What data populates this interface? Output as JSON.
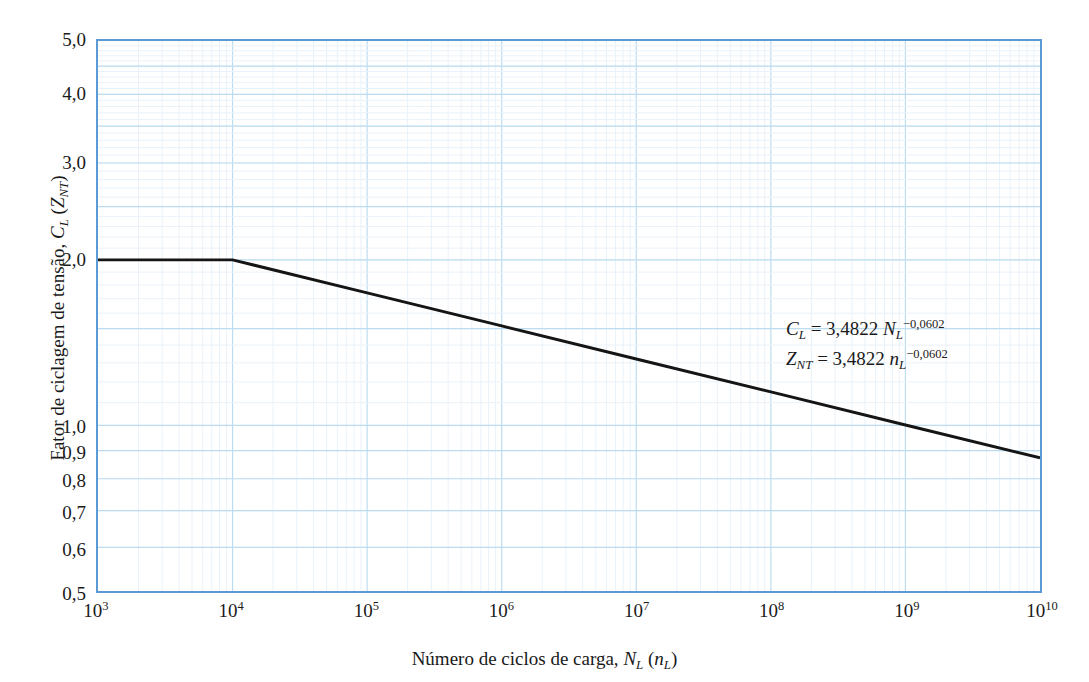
{
  "figure": {
    "background_color": "#ffffff",
    "frame_color": "#5b9bd5",
    "major_grid_color": "#bcdcf0",
    "minor_grid_color": "#e9f2fa",
    "curve_color": "#151515"
  },
  "axes": {
    "x": {
      "title_parts": {
        "text_before": "Número de ciclos de carga, ",
        "sym1": "N",
        "sub1": "L",
        "paren_open": " (",
        "sym2": "n",
        "sub2": "L",
        "paren_close": ")"
      },
      "title_plain": "Número de ciclos de carga, N_L (n_L)",
      "scale": "log",
      "ticks": [
        {
          "label_base": "10",
          "label_exp": "3",
          "value": 1000
        },
        {
          "label_base": "10",
          "label_exp": "4",
          "value": 10000
        },
        {
          "label_base": "10",
          "label_exp": "5",
          "value": 100000
        },
        {
          "label_base": "10",
          "label_exp": "6",
          "value": 1000000
        },
        {
          "label_base": "10",
          "label_exp": "7",
          "value": 10000000
        },
        {
          "label_base": "10",
          "label_exp": "8",
          "value": 100000000
        },
        {
          "label_base": "10",
          "label_exp": "9",
          "value": 1000000000
        },
        {
          "label_base": "10",
          "label_exp": "10",
          "value": 10000000000
        }
      ]
    },
    "y": {
      "title_parts": {
        "text_before": "Fator de ciclagem de tensão, ",
        "sym1": "C",
        "sub1": "L",
        "paren_open": " (",
        "sym2": "Z",
        "sub2": "NT",
        "paren_close": ")"
      },
      "title_plain": "Fator de ciclagem de tensão, C_L (Z_NT)",
      "scale": "log",
      "ticks": [
        {
          "label": "5,0",
          "value": 5.0
        },
        {
          "label": "4,0",
          "value": 4.0
        },
        {
          "label": "3,0",
          "value": 3.0
        },
        {
          "label": "2,0",
          "value": 2.0
        },
        {
          "label": "1,0",
          "value": 1.0
        },
        {
          "label": "0,9",
          "value": 0.9
        },
        {
          "label": "0,8",
          "value": 0.8
        },
        {
          "label": "0,7",
          "value": 0.7
        },
        {
          "label": "0,6",
          "value": 0.6
        },
        {
          "label": "0,5",
          "value": 0.5
        }
      ]
    }
  },
  "annotations": {
    "equation_1": {
      "lhs": "C",
      "lhs_sub": "L",
      "eq": " = 3,4822 ",
      "var": "N",
      "var_sub": "L",
      "exponent": "−0,0602",
      "plain": "C_L = 3,4822 N_L^-0,0602"
    },
    "equation_2": {
      "lhs": "Z",
      "lhs_sub": "NT",
      "eq": " = 3,4822 ",
      "var": "n",
      "var_sub": "L",
      "exponent": "−0,0602",
      "plain": "Z_NT = 3,4822 n_L^-0,0602"
    }
  },
  "chart_data": {
    "type": "line",
    "title": "",
    "xlabel": "Número de ciclos de carga, N_L (n_L)",
    "ylabel": "Fator de ciclagem de tensão, C_L (Z_NT)",
    "xscale": "log",
    "yscale": "log",
    "xlim": [
      1000,
      10000000000
    ],
    "ylim": [
      0.5,
      5.0
    ],
    "grid": true,
    "legend": null,
    "xtick_labels": [
      "10^3",
      "10^4",
      "10^5",
      "10^6",
      "10^7",
      "10^8",
      "10^9",
      "10^10"
    ],
    "xtick_values": [
      1000,
      10000,
      100000,
      1000000,
      10000000,
      100000000,
      1000000000,
      10000000000
    ],
    "ytick_labels": [
      "5,0",
      "4,0",
      "3,0",
      "2,0",
      "1,0",
      "0,9",
      "0,8",
      "0,7",
      "0,6",
      "0,5"
    ],
    "ytick_values": [
      5.0,
      4.0,
      3.0,
      2.0,
      1.0,
      0.9,
      0.8,
      0.7,
      0.6,
      0.5
    ],
    "series": [
      {
        "name": "C_L (Z_NT)",
        "color": "#151515",
        "linewidth": 3,
        "x": [
          1000,
          10000,
          100000,
          1000000,
          10000000,
          100000000,
          1000000000,
          10000000000
        ],
        "y": [
          2.0,
          2.0,
          1.742,
          1.517,
          1.321,
          1.151,
          1.002,
          0.873
        ],
        "note": "Constant at 2,0 from 1e3 to 1e4; beyond 1e4 follows C_L = 3,4822 * N_L^-0,0602"
      }
    ],
    "equations": [
      "C_L = 3,4822 N_L^-0,0602",
      "Z_NT = 3,4822 n_L^-0,0602"
    ]
  }
}
